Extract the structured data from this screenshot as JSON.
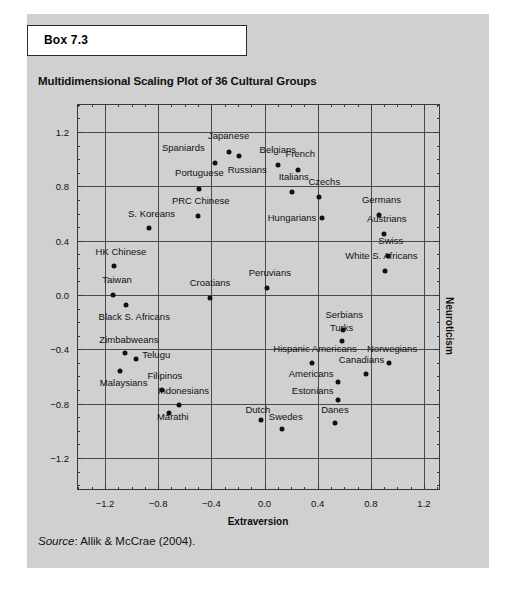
{
  "box": {
    "header_label": "Box 7.3"
  },
  "chart_title": "Multidimensional Scaling Plot of 36 Cultural Groups",
  "source": {
    "prefix": "Source",
    "text": ": Allik & McCrae (2004)."
  },
  "chart_data": {
    "type": "scatter",
    "title": "Multidimensional Scaling Plot of 36 Cultural Groups",
    "xlabel": "Extraversion",
    "ylabel": "Neuroticism",
    "xlim": [
      -1.41,
      1.32
    ],
    "ylim": [
      -1.4,
      1.4
    ],
    "grid": true,
    "legend": "none",
    "xticks": [
      -1.2,
      -0.8,
      -0.4,
      0.0,
      0.4,
      0.8,
      1.2
    ],
    "xticklabels": [
      "−1.2",
      "−0.8",
      "−0.4",
      "0.0",
      "0.4",
      "0.8",
      "1.2"
    ],
    "yticks": [
      1.2,
      0.8,
      0.4,
      0.0,
      -0.4,
      -0.8,
      -1.2
    ],
    "yticklabels": [
      "1.2",
      "0.8",
      "0.4",
      "0.0",
      "−0.4",
      "−0.8",
      "−1.2"
    ],
    "points": [
      {
        "label": "Japanese",
        "x": -0.27,
        "y": 1.05,
        "lx": -0.27,
        "ly": 1.17,
        "anchor": "center"
      },
      {
        "label": "Spaniards",
        "x": -0.37,
        "y": 0.97,
        "lx": -0.45,
        "ly": 1.08,
        "anchor": "right"
      },
      {
        "label": "Russians",
        "x": -0.19,
        "y": 1.02,
        "lx": -0.13,
        "ly": 0.92,
        "anchor": "center"
      },
      {
        "label": "Belgians",
        "x": 0.1,
        "y": 0.96,
        "lx": 0.1,
        "ly": 1.07,
        "anchor": "center"
      },
      {
        "label": "French",
        "x": 0.25,
        "y": 0.92,
        "lx": 0.27,
        "ly": 1.04,
        "anchor": "center"
      },
      {
        "label": "Italians",
        "x": 0.21,
        "y": 0.76,
        "lx": 0.22,
        "ly": 0.87,
        "anchor": "center"
      },
      {
        "label": "Czechs",
        "x": 0.41,
        "y": 0.72,
        "lx": 0.45,
        "ly": 0.83,
        "anchor": "center"
      },
      {
        "label": "Portuguese",
        "x": -0.49,
        "y": 0.78,
        "lx": -0.49,
        "ly": 0.9,
        "anchor": "center"
      },
      {
        "label": "PRC Chinese",
        "x": -0.5,
        "y": 0.58,
        "lx": -0.48,
        "ly": 0.69,
        "anchor": "center"
      },
      {
        "label": "S. Koreans",
        "x": -0.87,
        "y": 0.49,
        "lx": -0.85,
        "ly": 0.6,
        "anchor": "center"
      },
      {
        "label": "Hungarians",
        "x": 0.43,
        "y": 0.57,
        "lx": 0.39,
        "ly": 0.57,
        "anchor": "right"
      },
      {
        "label": "Germans",
        "x": 0.86,
        "y": 0.59,
        "lx": 0.88,
        "ly": 0.7,
        "anchor": "center"
      },
      {
        "label": "Austrians",
        "x": 0.9,
        "y": 0.45,
        "lx": 0.92,
        "ly": 0.56,
        "anchor": "center"
      },
      {
        "label": "Swiss",
        "x": 0.93,
        "y": 0.29,
        "lx": 0.95,
        "ly": 0.4,
        "anchor": "center"
      },
      {
        "label": "White S. Africans",
        "x": 0.91,
        "y": 0.18,
        "lx": 0.88,
        "ly": 0.29,
        "anchor": "center"
      },
      {
        "label": "HK Chinese",
        "x": -1.13,
        "y": 0.21,
        "lx": -1.08,
        "ly": 0.32,
        "anchor": "center"
      },
      {
        "label": "Taiwan",
        "x": -1.14,
        "y": 0.0,
        "lx": -1.11,
        "ly": 0.11,
        "anchor": "center"
      },
      {
        "label": "Black S. Africans",
        "x": -1.04,
        "y": -0.07,
        "lx": -0.98,
        "ly": -0.16,
        "anchor": "center"
      },
      {
        "label": "Croatians",
        "x": -0.41,
        "y": -0.02,
        "lx": -0.41,
        "ly": 0.09,
        "anchor": "center"
      },
      {
        "label": "Peruvians",
        "x": 0.02,
        "y": 0.05,
        "lx": 0.04,
        "ly": 0.16,
        "anchor": "center"
      },
      {
        "label": "Serbians",
        "x": 0.59,
        "y": -0.26,
        "lx": 0.6,
        "ly": -0.15,
        "anchor": "center"
      },
      {
        "label": "Turks",
        "x": 0.58,
        "y": -0.34,
        "lx": 0.58,
        "ly": -0.24,
        "anchor": "center"
      },
      {
        "label": "Zimbabweans",
        "x": -1.05,
        "y": -0.43,
        "lx": -1.02,
        "ly": -0.33,
        "anchor": "center"
      },
      {
        "label": "Telugu",
        "x": -0.97,
        "y": -0.47,
        "lx": -0.92,
        "ly": -0.44,
        "anchor": "left"
      },
      {
        "label": "Malaysians",
        "x": -1.09,
        "y": -0.56,
        "lx": -1.06,
        "ly": -0.65,
        "anchor": "center"
      },
      {
        "label": "Hispanic Americans",
        "x": 0.36,
        "y": -0.5,
        "lx": 0.38,
        "ly": -0.4,
        "anchor": "center"
      },
      {
        "label": "Norwegians",
        "x": 0.94,
        "y": -0.5,
        "lx": 0.96,
        "ly": -0.4,
        "anchor": "center"
      },
      {
        "label": "Canadians",
        "x": 0.76,
        "y": -0.58,
        "lx": 0.73,
        "ly": -0.48,
        "anchor": "center"
      },
      {
        "label": "Americans",
        "x": 0.55,
        "y": -0.64,
        "lx": 0.52,
        "ly": -0.58,
        "anchor": "right"
      },
      {
        "label": "Filipinos",
        "x": -0.77,
        "y": -0.7,
        "lx": -0.75,
        "ly": -0.6,
        "anchor": "center"
      },
      {
        "label": "Indonesians",
        "x": -0.64,
        "y": -0.81,
        "lx": -0.61,
        "ly": -0.71,
        "anchor": "center"
      },
      {
        "label": "Estonians",
        "x": 0.55,
        "y": -0.77,
        "lx": 0.52,
        "ly": -0.71,
        "anchor": "right"
      },
      {
        "label": "Marathi",
        "x": -0.72,
        "y": -0.87,
        "lx": -0.69,
        "ly": -0.9,
        "anchor": "center"
      },
      {
        "label": "Dutch",
        "x": -0.03,
        "y": -0.92,
        "lx": -0.05,
        "ly": -0.85,
        "anchor": "center"
      },
      {
        "label": "Swedes",
        "x": 0.13,
        "y": -0.99,
        "lx": 0.16,
        "ly": -0.9,
        "anchor": "center"
      },
      {
        "label": "Danes",
        "x": 0.53,
        "y": -0.94,
        "lx": 0.53,
        "ly": -0.85,
        "anchor": "center"
      }
    ]
  }
}
